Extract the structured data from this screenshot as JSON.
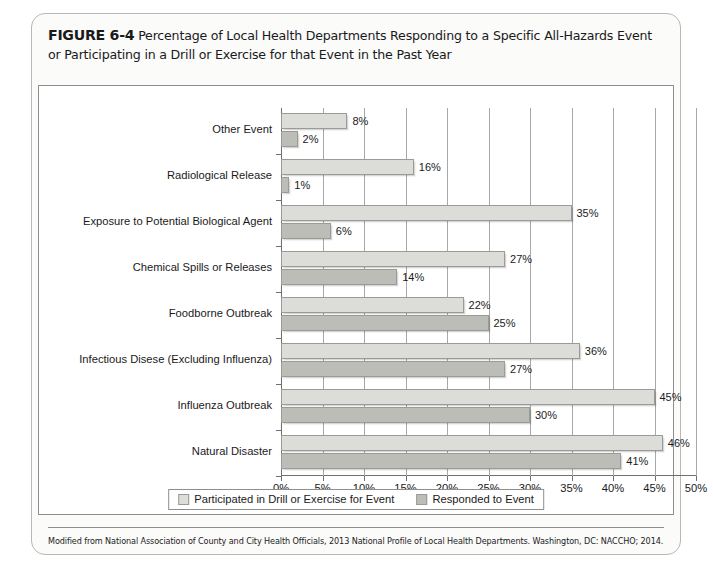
{
  "figure": {
    "label": "FIGURE 6-4",
    "title": "Percentage of Local Health Departments Responding to a Specific All-Hazards Event or Participating in a Drill or Exercise for that Event in the Past Year",
    "source_note": "Modified from National Association of County and City Health Officials, 2013 National Profile of Local Health Departments. Washington, DC: NACCHO; 2014."
  },
  "colors": {
    "series_light": "#dcdcd8",
    "series_dark": "#bdbdb8",
    "bar_border": "#9a9a96",
    "axis": "#6f6f6f",
    "gridline": "#a8a8a8",
    "card_border": "#b9b9b4",
    "panel_border": "#8e8e8e",
    "text": "#1a1a1a"
  },
  "chart_data": {
    "type": "bar",
    "orientation": "horizontal",
    "title": "Percentage of Local Health Departments Responding to a Specific All-Hazards Event or Participating in a Drill or Exercise for that Event in the Past Year",
    "xlabel": "",
    "ylabel": "",
    "xlim": [
      0,
      50
    ],
    "xticks": [
      0,
      5,
      10,
      15,
      20,
      25,
      30,
      35,
      40,
      45,
      50
    ],
    "xtick_labels": [
      "0%",
      "5%",
      "10%",
      "15%",
      "20%",
      "25%",
      "30%",
      "35%",
      "40%",
      "45%",
      "50%"
    ],
    "grid": true,
    "legend_position": "bottom",
    "categories": [
      "Other Event",
      "Radiological Release",
      "Exposure to Potential Biological Agent",
      "Chemical Spills or Releases",
      "Foodborne Outbreak",
      "Infectious Disese (Excluding Influenza)",
      "Influenza Outbreak",
      "Natural Disaster"
    ],
    "series": [
      {
        "name": "Participated in Drill or Exercise for Event",
        "color": "#dcdcd8",
        "values": [
          8,
          16,
          35,
          27,
          22,
          36,
          45,
          46
        ],
        "value_labels": [
          "8%",
          "16%",
          "35%",
          "27%",
          "22%",
          "36%",
          "45%",
          "46%"
        ]
      },
      {
        "name": "Responded to Event",
        "color": "#bdbdb8",
        "values": [
          2,
          1,
          6,
          14,
          25,
          27,
          30,
          41
        ],
        "value_labels": [
          "2%",
          "1%",
          "6%",
          "14%",
          "25%",
          "27%",
          "30%",
          "41%"
        ]
      }
    ]
  }
}
